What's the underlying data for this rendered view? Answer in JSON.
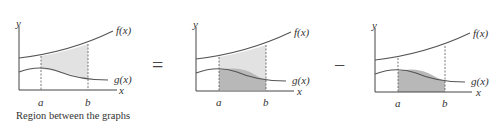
{
  "panels": [
    {
      "id": "between",
      "y_label": "y",
      "x_label": "x",
      "a_label": "a",
      "b_label": "b",
      "f_label": "f(x)",
      "g_label": "g(x)",
      "shaded": "between f and g",
      "caption": "Region between the graphs"
    },
    {
      "id": "under_f",
      "y_label": "y",
      "x_label": "x",
      "a_label": "a",
      "b_label": "b",
      "f_label": "f(x)",
      "g_label": "g(x)",
      "shaded": "under f, under g darker"
    },
    {
      "id": "under_g",
      "y_label": "y",
      "x_label": "x",
      "a_label": "a",
      "b_label": "b",
      "f_label": "f(x)",
      "g_label": "g(x)",
      "shaded": "under g"
    }
  ],
  "operators": {
    "equals": "=",
    "minus": "−"
  },
  "colors": {
    "light_fill": "#e2e2e2",
    "dark_fill": "#b8b8b8",
    "stroke": "#555555"
  }
}
